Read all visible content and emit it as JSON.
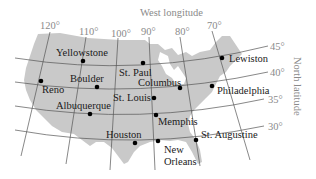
{
  "map": {
    "axis_titles": {
      "longitude": "West longitude",
      "latitude": "North latitude"
    },
    "longitude_ticks": [
      {
        "label": "120°",
        "x": 40,
        "y": 29
      },
      {
        "label": "110°",
        "x": 79,
        "y": 35
      },
      {
        "label": "100°",
        "x": 111,
        "y": 37
      },
      {
        "label": "90°",
        "x": 141,
        "y": 35
      },
      {
        "label": "80°",
        "x": 175,
        "y": 35
      },
      {
        "label": "70°",
        "x": 207,
        "y": 29
      }
    ],
    "latitude_ticks": [
      {
        "label": "45°",
        "x": 270,
        "y": 50
      },
      {
        "label": "40°",
        "x": 270,
        "y": 76
      },
      {
        "label": "35°",
        "x": 268,
        "y": 103
      },
      {
        "label": "30°",
        "x": 268,
        "y": 130
      }
    ],
    "cities": [
      {
        "name": "Yellowstone",
        "dot": [
          83,
          61
        ],
        "label": [
          56,
          56
        ]
      },
      {
        "name": "St. Paul",
        "dot": [
          143,
          63
        ],
        "label": [
          119,
          76
        ]
      },
      {
        "name": "Lewiston",
        "dot": [
          222,
          58
        ],
        "label": [
          229,
          62
        ]
      },
      {
        "name": "Reno",
        "dot": [
          41,
          81
        ],
        "label": [
          42,
          93
        ]
      },
      {
        "name": "Boulder",
        "dot": [
          97,
          87
        ],
        "label": [
          70,
          82
        ]
      },
      {
        "name": "Columbus",
        "dot": [
          180,
          88
        ],
        "label": [
          138,
          86
        ]
      },
      {
        "name": "Philadelphia",
        "dot": [
          212,
          86
        ],
        "label": [
          217,
          94
        ]
      },
      {
        "name": "St. Louis",
        "dot": [
          154,
          98
        ],
        "label": [
          113,
          101
        ]
      },
      {
        "name": "Albuquerque",
        "dot": [
          90,
          114
        ],
        "label": [
          56,
          109
        ]
      },
      {
        "name": "Memphis",
        "dot": [
          156,
          115
        ],
        "label": [
          158,
          125
        ]
      },
      {
        "name": "Houston",
        "dot": [
          135,
          143
        ],
        "label": [
          106,
          138
        ]
      },
      {
        "name": "New Orleans",
        "dot": [
          158,
          141
        ],
        "label_lines": [
          "New",
          "Orleans"
        ],
        "label": [
          164,
          153
        ]
      },
      {
        "name": "St. Augustine",
        "dot": [
          196,
          140
        ],
        "label": [
          201,
          138
        ]
      }
    ],
    "colors": {
      "land": "#c9c9c9",
      "grid": "#555555",
      "axis_text": "#8a8a8a",
      "city_text": "#1a1a1a",
      "dot": "#000000"
    }
  }
}
